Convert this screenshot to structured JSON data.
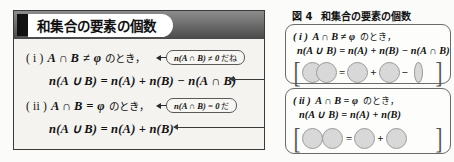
{
  "left_panel": {
    "header_title": "和集合の要素の個数",
    "statements": [
      {
        "label": "( i )",
        "condition": "A ∩ B",
        "relation": "≠",
        "empty_set": "φ",
        "suffix_jp": "のとき，",
        "formula": "n(A ∪ B) = n(A) + n(B) − n(A ∩ B)",
        "callout_math": "n(A ∩ B) ≠ 0",
        "callout_jp": "だね"
      },
      {
        "label": "( ii )",
        "condition": "A ∩ B",
        "relation": "=",
        "empty_set": "φ",
        "suffix_jp": "のとき，",
        "formula": "n(A ∪ B) = n(A) + n(B)",
        "callout_math": "n(A ∩ B) = 0",
        "callout_jp": "だ"
      }
    ]
  },
  "figure": {
    "caption_number": "図 4",
    "caption_title": "和集合の要素の個数",
    "boxes": [
      {
        "label": "( i )",
        "condition_line": "A ∩ B ≠ φ",
        "condition_jp": "のとき，",
        "equation": "n(A ∪ B) = n(A) + n(B) − n(A ∩ B)",
        "venn": {
          "type": "overlapping",
          "operators": [
            "=",
            "+",
            "−"
          ],
          "shapes": [
            "overlap-pair",
            "circle",
            "circle",
            "lens"
          ]
        }
      },
      {
        "label": "( ii )",
        "condition_line": "A ∩ B = φ",
        "condition_jp": "のとき，",
        "equation": "n(A ∪ B) = n(A) + n(B)",
        "venn": {
          "type": "disjoint",
          "operators": [
            "=",
            "+"
          ],
          "shapes": [
            "adjacent-pair",
            "circle",
            "circle"
          ]
        }
      }
    ],
    "bracket_open": "[",
    "bracket_close": "]"
  },
  "colors": {
    "panel_bg": "#f4f3f0",
    "header_band": "#6f6f6f",
    "border": "#3a3a3a",
    "venn_fill": "#d8d8d8",
    "venn_stroke": "#9a9a9a"
  }
}
